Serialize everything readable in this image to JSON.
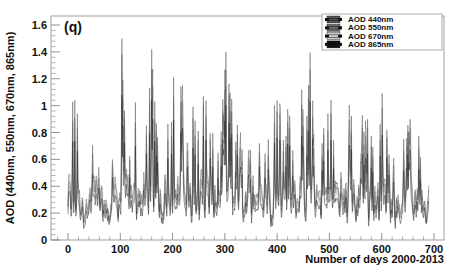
{
  "chart_data": {
    "type": "line",
    "title": "",
    "panel_label": "(q)",
    "xlabel": "Number of days 2000-2013",
    "ylabel": "AOD (440nm, 550nm, 670nm, 865nm)",
    "xlim": [
      -25,
      740
    ],
    "ylim": [
      0,
      1.65
    ],
    "x_ticks": [
      0,
      100,
      200,
      300,
      400,
      500,
      600,
      700
    ],
    "y_ticks": [
      0,
      0.2,
      0.4,
      0.6,
      0.8,
      1,
      1.2,
      1.4,
      1.6
    ],
    "y_tick_labels": [
      "0",
      "0.2",
      "0.4",
      "0.6",
      "0.8",
      "1",
      "1.2",
      "1.4",
      "1.6"
    ],
    "grid": false,
    "legend_position": "top-right",
    "legend": [
      "AOD 440nm",
      "AOD 550nm",
      "AOD 670nm",
      "AOD 865nm"
    ],
    "series_colors": [
      "#555555",
      "#6e6e6e",
      "#cfcfcf",
      "#111111"
    ],
    "peak_envelope": {
      "x": [
        0,
        8,
        20,
        30,
        38,
        48,
        57,
        65,
        75,
        85,
        95,
        103,
        112,
        120,
        130,
        140,
        150,
        160,
        170,
        180,
        190,
        200,
        210,
        220,
        230,
        240,
        250,
        262,
        272,
        282,
        292,
        302,
        312,
        322,
        332,
        342,
        352,
        362,
        372,
        382,
        392,
        402,
        412,
        422,
        432,
        442,
        452,
        462,
        472,
        482,
        492,
        502,
        512,
        522,
        532,
        542,
        552,
        562,
        572,
        582,
        592,
        602,
        612,
        622,
        632,
        642,
        652,
        662,
        672,
        682
      ],
      "values": [
        0.95,
        1.05,
        1.07,
        0.55,
        0.4,
        0.85,
        1.4,
        0.9,
        0.3,
        0.75,
        1.0,
        1.55,
        1.1,
        0.55,
        1.1,
        1.05,
        0.95,
        1.5,
        0.95,
        0.6,
        0.9,
        1.2,
        1.58,
        1.1,
        0.85,
        1.15,
        1.05,
        1.4,
        0.9,
        0.65,
        0.75,
        1.52,
        1.1,
        0.95,
        0.8,
        0.55,
        1.0,
        1.05,
        0.75,
        0.9,
        1.05,
        1.35,
        0.85,
        1.1,
        0.75,
        1.65,
        0.75,
        1.55,
        0.85,
        0.7,
        0.95,
        1.25,
        0.55,
        0.9,
        0.95,
        1.05,
        0.4,
        0.95,
        1.0,
        0.75,
        0.85,
        1.4,
        0.7,
        0.65,
        0.5,
        0.75,
        0.95,
        1.0,
        0.9,
        0.4
      ],
      "baseline_min": 0.08
    }
  }
}
